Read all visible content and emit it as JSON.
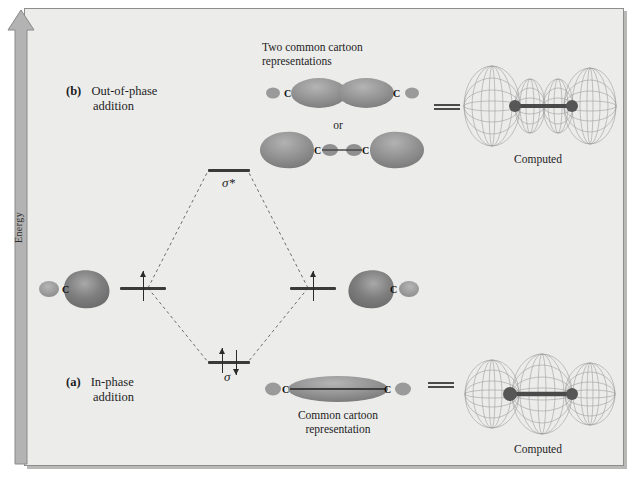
{
  "figure": {
    "axis_label": "Energy",
    "panel_b": {
      "tag": "(b)",
      "line1": "Out-of-phase",
      "line2": "addition"
    },
    "panel_a": {
      "tag": "(a)",
      "line1": "In-phase",
      "line2": "addition"
    },
    "antibonding": {
      "orbital_symbol": "σ*",
      "cartoon_caption_line1": "Two common cartoon",
      "cartoon_caption_line2": "representations",
      "or_text": "or",
      "computed_label": "Computed",
      "atom_labels": [
        "C",
        "C"
      ],
      "atom_labels_alt": [
        "C",
        "C"
      ]
    },
    "bonding": {
      "orbital_symbol": "σ",
      "cartoon_caption_line1": "Common cartoon",
      "cartoon_caption_line2": "representation",
      "computed_label": "Computed",
      "atom_labels": [
        "C",
        "C"
      ]
    },
    "atomic_orbitals": {
      "left_atom_label": "C",
      "right_atom_label": "C"
    },
    "colors": {
      "plate_background": "#ececeb",
      "frame": "#8e8e8e",
      "arrow_fill": "#b3b3b3",
      "level": "#3a3a3a",
      "dashed_line": "#6e6e6e",
      "text": "#1d1d1d",
      "lobe_dark": "#6d6d6d",
      "lobe_light": "#c9c9c9",
      "mesh": "#9a9a9a",
      "nucleus": "#555555"
    }
  }
}
